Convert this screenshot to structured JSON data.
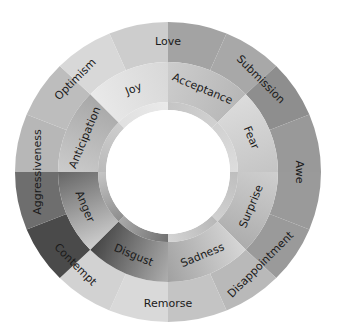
{
  "diagram": {
    "center": [
      168,
      172
    ],
    "inner_hole_radius": 62,
    "inner_band_radius": 70,
    "primary_outer_radius": 110,
    "outer_radius_x": 153,
    "outer_radius_y": 150,
    "primary_emotions": [
      {
        "label": "Joy",
        "start": -45,
        "end": 0,
        "fill_a": "#ebebeb",
        "fill_b": "#d6d6d6"
      },
      {
        "label": "Acceptance",
        "start": 0,
        "end": 45,
        "fill_a": "#cfcfcf",
        "fill_b": "#b4b4b4"
      },
      {
        "label": "Fear",
        "start": 45,
        "end": 90,
        "fill_a": "#dedede",
        "fill_b": "#c2c2c2"
      },
      {
        "label": "Surprise",
        "start": 90,
        "end": 135,
        "fill_a": "#d2d2d2",
        "fill_b": "#a9a9a9"
      },
      {
        "label": "Sadness",
        "start": 135,
        "end": 180,
        "fill_a": "#dcdcdc",
        "fill_b": "#9c9c9c"
      },
      {
        "label": "Disgust",
        "start": 180,
        "end": 225,
        "fill_a": "#b8b8b8",
        "fill_b": "#3a3a3a"
      },
      {
        "label": "Anger",
        "start": 225,
        "end": 270,
        "fill_a": "#d8d8d8",
        "fill_b": "#5c5c5c"
      },
      {
        "label": "Anticipation",
        "start": 270,
        "end": 315,
        "fill_a": "#cfcfcf",
        "fill_b": "#a4a4a4"
      }
    ],
    "dyads": [
      {
        "label": "Love",
        "angle": 0,
        "fill_left": "#cdcdcd",
        "fill_right": "#a3a3a3"
      },
      {
        "label": "Submission",
        "angle": 45,
        "fill_left": "#a8a8a8",
        "fill_right": "#8e8e8e"
      },
      {
        "label": "Awe",
        "angle": 90,
        "fill_left": "#999999",
        "fill_right": "#9a9a9a"
      },
      {
        "label": "Disappointment",
        "angle": 135,
        "fill_left": "#9a9a9a",
        "fill_right": "#b9b9b9"
      },
      {
        "label": "Remorse",
        "angle": 180,
        "fill_left": "#c4c4c4",
        "fill_right": "#d9d9d9"
      },
      {
        "label": "Contempt",
        "angle": 225,
        "fill_left": "#d2d2d2",
        "fill_right": "#4a4a4a"
      },
      {
        "label": "Aggressiveness",
        "angle": 270,
        "fill_left": "#6e6e6e",
        "fill_right": "#b7b7b7"
      },
      {
        "label": "Optimism",
        "angle": 315,
        "fill_left": "#bdbdbd",
        "fill_right": "#d8d8d8"
      }
    ]
  }
}
